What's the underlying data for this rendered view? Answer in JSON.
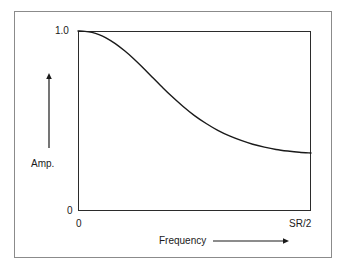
{
  "figure": {
    "background_color": "#ffffff",
    "frame_color": "#8b8b8b",
    "axis_color": "#2b2b2b",
    "curve_color": "#1a1a1a"
  },
  "axes": {
    "y_title": "Amp.",
    "y_tick_top": "1.0",
    "y_tick_bottom": "0",
    "x_title": "Frequency",
    "x_tick_left": "0",
    "x_tick_right": "SR/2",
    "y_arrow_icon": "arrow-up-icon",
    "x_arrow_icon": "arrow-right-icon"
  },
  "chart_data": {
    "type": "line",
    "title": "",
    "subtitle": "",
    "xlabel": "Frequency",
    "ylabel": "Amp.",
    "xlim": [
      0,
      1
    ],
    "ylim": [
      0,
      1
    ],
    "x_tick_labels": [
      "0",
      "SR/2"
    ],
    "y_tick_labels": [
      "0",
      "1.0"
    ],
    "grid": false,
    "legend": false,
    "legend_position": "none",
    "annotations": [],
    "series": [
      {
        "name": "Lowpass filter response",
        "x": [
          0.0,
          0.03,
          0.06,
          0.09,
          0.12,
          0.16,
          0.2,
          0.24,
          0.28,
          0.32,
          0.36,
          0.4,
          0.45,
          0.5,
          0.55,
          0.6,
          0.65,
          0.7,
          0.75,
          0.8,
          0.85,
          0.9,
          0.95,
          1.0
        ],
        "y": [
          1.0,
          0.998,
          0.992,
          0.98,
          0.962,
          0.93,
          0.89,
          0.845,
          0.795,
          0.742,
          0.69,
          0.64,
          0.582,
          0.53,
          0.486,
          0.448,
          0.417,
          0.392,
          0.371,
          0.355,
          0.342,
          0.333,
          0.326,
          0.322
        ]
      }
    ],
    "asymptote": 0.31
  }
}
